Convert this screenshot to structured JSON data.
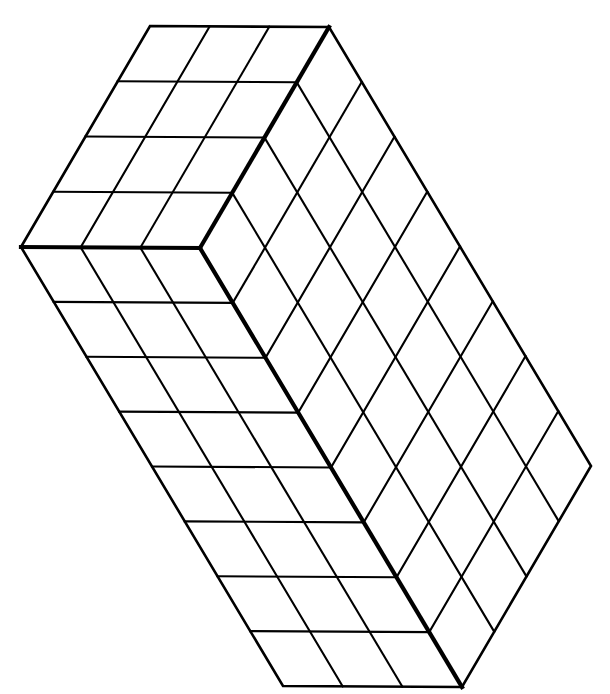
{
  "figure": {
    "title": "Isometric rectangular prism built from unit cubes",
    "kind": "isometric-cuboid",
    "background_color": "#ffffff",
    "line_color": "#000000",
    "fill_color": "#ffffff",
    "stroke_width_grid": 2.1,
    "stroke_width_outline": 2.6,
    "stroke_width_bold_edge": 4.2
  },
  "chart_data": {
    "type": "diagram",
    "dimensions": {
      "width_cubes": 3,
      "depth_cubes": 4,
      "height_cubes": 8,
      "total_cubes": 96
    },
    "visible_faces": [
      {
        "name": "top-face",
        "rows": 4,
        "cols": 3,
        "cells": 12
      },
      {
        "name": "front-left-face",
        "rows": 8,
        "cols": 3,
        "cells": 24
      },
      {
        "name": "front-right-face",
        "rows": 8,
        "cols": 4,
        "cells": 32
      }
    ],
    "vertices": {
      "front_top": [
        200,
        248
      ],
      "left_top": [
        21,
        247
      ],
      "back_top": [
        152,
        25
      ],
      "right_top": [
        329,
        27
      ],
      "front_bottom": [
        462,
        687
      ],
      "left_bottom": [
        283,
        686
      ],
      "right_bottom": [
        591,
        466
      ]
    },
    "unit_vectors": {
      "u_width": [
        -59.667,
        -0.333
      ],
      "v_depth": [
        32.25,
        -55.25
      ],
      "w_height": [
        32.75,
        54.875
      ]
    }
  }
}
